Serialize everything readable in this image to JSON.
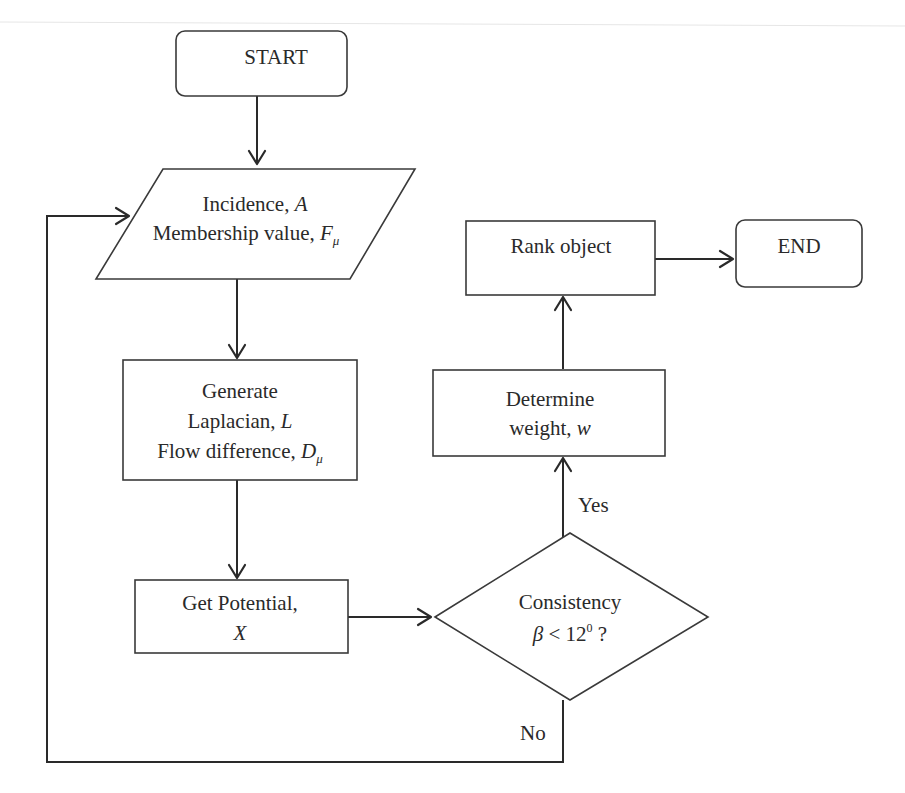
{
  "diagram": {
    "type": "flowchart",
    "nodes": {
      "start": {
        "shape": "terminal",
        "label": "START"
      },
      "input": {
        "shape": "input-output",
        "line1": "Incidence,",
        "line1_var": "A",
        "line2": "Membership value,",
        "line2_var": "F",
        "line2_sub": "μ"
      },
      "generate": {
        "shape": "process",
        "line1": "Generate",
        "line2": "Laplacian,",
        "line2_var": "L",
        "line3": "Flow difference,",
        "line3_var": "D",
        "line3_sub": "μ"
      },
      "potential": {
        "shape": "process",
        "line1": "Get Potential,",
        "line2_var": "X"
      },
      "decision": {
        "shape": "decision",
        "line1": "Consistency",
        "line2_var": "β",
        "line2_op": " < 12",
        "line2_sup": "0",
        "line2_tail": " ?"
      },
      "weight": {
        "shape": "process",
        "line1": "Determine",
        "line2": "weight,",
        "line2_var": "w"
      },
      "rank": {
        "shape": "process",
        "label": "Rank object"
      },
      "end": {
        "shape": "terminal",
        "label": "END"
      }
    },
    "edges": [
      {
        "from": "start",
        "to": "input",
        "label": ""
      },
      {
        "from": "input",
        "to": "generate",
        "label": ""
      },
      {
        "from": "generate",
        "to": "potential",
        "label": ""
      },
      {
        "from": "potential",
        "to": "decision",
        "label": ""
      },
      {
        "from": "decision",
        "to": "weight",
        "label": "Yes"
      },
      {
        "from": "decision",
        "to": "input",
        "label": "No"
      },
      {
        "from": "weight",
        "to": "rank",
        "label": ""
      },
      {
        "from": "rank",
        "to": "end",
        "label": ""
      }
    ],
    "edge_labels": {
      "yes": "Yes",
      "no": "No"
    }
  }
}
